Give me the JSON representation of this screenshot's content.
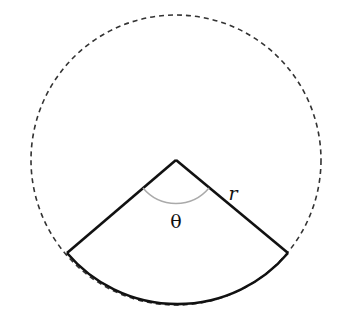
{
  "diagram": {
    "center": [
      176,
      160
    ],
    "radius": 145,
    "sector_endpoints": [
      [
        67,
        253
      ],
      [
        288,
        253
      ]
    ],
    "labels": {
      "radius": "r",
      "angle": "θ"
    },
    "colors": {
      "stroke": "#111111",
      "dashed_circle": "#333333",
      "angle_arc": "#aaaaaa",
      "background": "#ffffff"
    }
  }
}
